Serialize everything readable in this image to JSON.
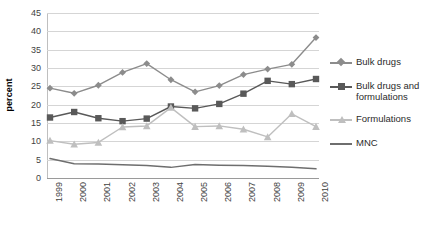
{
  "chart_data": {
    "type": "line",
    "title": "",
    "xlabel": "",
    "ylabel": "percent",
    "categories": [
      "1999",
      "2000",
      "2001",
      "2002",
      "2003",
      "2004",
      "2005",
      "2006",
      "2007",
      "2008",
      "2009",
      "2010"
    ],
    "ylim": [
      0,
      45
    ],
    "ytick_step": 5,
    "yticks": [
      "45",
      "40",
      "35",
      "30",
      "25",
      "20",
      "15",
      "10",
      "5",
      "0"
    ],
    "grid": true,
    "legend_position": "right",
    "series": [
      {
        "name": "Bulk drugs",
        "marker": "diamond",
        "color": "#8c8c8c",
        "values": [
          24.5,
          23.1,
          25.3,
          28.8,
          31.2,
          26.8,
          23.5,
          25.2,
          28.2,
          29.7,
          31.0,
          38.3
        ]
      },
      {
        "name": "Bulk drugs and formulations",
        "marker": "square",
        "color": "#595959",
        "values": [
          16.5,
          18.0,
          16.3,
          15.5,
          16.2,
          19.5,
          19.0,
          20.2,
          23.0,
          26.5,
          25.6,
          27.0
        ]
      },
      {
        "name": "Formulations",
        "marker": "triangle",
        "color": "#bfbfbf",
        "values": [
          10.2,
          9.2,
          9.7,
          13.9,
          14.2,
          19.2,
          14.0,
          14.2,
          13.3,
          11.2,
          17.5,
          14.0
        ]
      },
      {
        "name": "MNC",
        "marker": "none",
        "color": "#6e6e6e",
        "values": [
          5.3,
          3.9,
          3.8,
          3.6,
          3.4,
          2.9,
          3.7,
          3.5,
          3.4,
          3.2,
          2.9,
          2.5
        ]
      }
    ]
  },
  "legend": {
    "items": [
      {
        "label": "Bulk drugs"
      },
      {
        "label": "Bulk drugs and\nformulations"
      },
      {
        "label": "Formulations"
      },
      {
        "label": "MNC"
      }
    ]
  }
}
